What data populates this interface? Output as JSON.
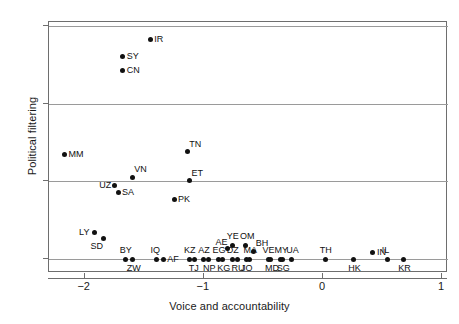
{
  "chart_data": {
    "type": "scatter",
    "title": "",
    "xlabel": "Voice and accountability",
    "ylabel": "Political filtering",
    "xlim": [
      -2.3,
      1.05
    ],
    "ylim": [
      -0.018,
      0.305
    ],
    "xticks": [
      -2,
      -1,
      0,
      1
    ],
    "xticklabels": [
      "−2",
      "−1",
      "0",
      "1"
    ],
    "yticks": [
      0,
      0.1,
      0.2,
      0.3
    ],
    "yticklabels": [
      "0",
      ".1",
      ".2",
      ".3"
    ],
    "grid": "horizontal",
    "legend": "none",
    "marker": "diamond",
    "marker_color": "#111111",
    "points": [
      {
        "label": "IR",
        "x": -1.45,
        "y": 0.283,
        "lpos": "right"
      },
      {
        "label": "SY",
        "x": -1.68,
        "y": 0.26,
        "lpos": "right"
      },
      {
        "label": "CN",
        "x": -1.68,
        "y": 0.243,
        "lpos": "right"
      },
      {
        "label": "MM",
        "x": -2.17,
        "y": 0.135,
        "lpos": "right"
      },
      {
        "label": "TN",
        "x": -1.14,
        "y": 0.138,
        "lpos": "above-right"
      },
      {
        "label": "VN",
        "x": -1.6,
        "y": 0.105,
        "lpos": "above-right"
      },
      {
        "label": "ET",
        "x": -1.12,
        "y": 0.101,
        "lpos": "above-right"
      },
      {
        "label": "UZ",
        "x": -1.75,
        "y": 0.094,
        "lpos": "left"
      },
      {
        "label": "SA",
        "x": -1.72,
        "y": 0.085,
        "lpos": "right"
      },
      {
        "label": "PK",
        "x": -1.25,
        "y": 0.076,
        "lpos": "right"
      },
      {
        "label": "LY",
        "x": -1.92,
        "y": 0.034,
        "lpos": "left"
      },
      {
        "label": "SD",
        "x": -1.84,
        "y": 0.027,
        "lpos": "below-left"
      },
      {
        "label": "AE",
        "x": -0.8,
        "y": 0.013,
        "lpos": "above-left"
      },
      {
        "label": "YE",
        "x": -0.76,
        "y": 0.018,
        "lpos": "above"
      },
      {
        "label": "OM",
        "x": -0.65,
        "y": 0.018,
        "lpos": "above"
      },
      {
        "label": "BH",
        "x": -0.58,
        "y": 0.01,
        "lpos": "above-right"
      },
      {
        "label": "BY",
        "x": -1.66,
        "y": 0.0,
        "lpos": "above"
      },
      {
        "label": "ZW",
        "x": -1.6,
        "y": 0.0,
        "lpos": "below"
      },
      {
        "label": "IQ",
        "x": -1.4,
        "y": 0.0,
        "lpos": "above"
      },
      {
        "label": "AF",
        "x": -1.34,
        "y": 0.0,
        "lpos": "right"
      },
      {
        "label": "KZ",
        "x": -1.12,
        "y": 0.0,
        "lpos": "above"
      },
      {
        "label": "TJ",
        "x": -1.08,
        "y": 0.0,
        "lpos": "below"
      },
      {
        "label": "AZ",
        "x": -1.0,
        "y": 0.0,
        "lpos": "above"
      },
      {
        "label": "NP",
        "x": -0.96,
        "y": 0.0,
        "lpos": "below"
      },
      {
        "label": "EG",
        "x": -0.88,
        "y": 0.0,
        "lpos": "above"
      },
      {
        "label": "KG",
        "x": -0.84,
        "y": 0.0,
        "lpos": "below"
      },
      {
        "label": "DZ",
        "x": -0.76,
        "y": 0.0,
        "lpos": "above"
      },
      {
        "label": "RU",
        "x": -0.72,
        "y": 0.0,
        "lpos": "below"
      },
      {
        "label": "MA",
        "x": -0.62,
        "y": 0.0,
        "lpos": "above"
      },
      {
        "label": "JO",
        "x": -0.64,
        "y": 0.0,
        "lpos": "below"
      },
      {
        "label": "VE",
        "x": -0.46,
        "y": 0.0,
        "lpos": "above"
      },
      {
        "label": "MD",
        "x": -0.44,
        "y": 0.0,
        "lpos": "below"
      },
      {
        "label": "MY",
        "x": -0.36,
        "y": 0.0,
        "lpos": "above"
      },
      {
        "label": "SG",
        "x": -0.34,
        "y": 0.0,
        "lpos": "below"
      },
      {
        "label": "UA",
        "x": -0.26,
        "y": 0.0,
        "lpos": "above"
      },
      {
        "label": "TH",
        "x": 0.02,
        "y": 0.0,
        "lpos": "above"
      },
      {
        "label": "HK",
        "x": 0.26,
        "y": 0.0,
        "lpos": "below"
      },
      {
        "label": "IN",
        "x": 0.42,
        "y": 0.008,
        "lpos": "right"
      },
      {
        "label": "IL",
        "x": 0.54,
        "y": 0.0,
        "lpos": "above"
      },
      {
        "label": "KR",
        "x": 0.68,
        "y": 0.0,
        "lpos": "below"
      }
    ]
  }
}
